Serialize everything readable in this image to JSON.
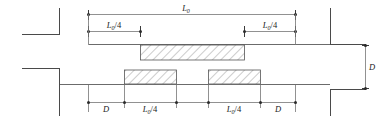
{
  "figure": {
    "type": "engineering-detail-drawing",
    "background_color": "#ffffff",
    "line_color": "#6b6b6b",
    "hatch_color": "#6d6d6d",
    "label_color": "#1a1a1a"
  },
  "labels": {
    "span_total": {
      "symbol": "L",
      "subscript": "0",
      "suffix": ""
    },
    "quarter_span": {
      "symbol": "L",
      "subscript": "0",
      "suffix": "/4"
    },
    "depth": {
      "symbol": "D",
      "subscript": "",
      "suffix": ""
    }
  },
  "label_text": {
    "L0": "L",
    "L0_sub": "0",
    "L0_quarter_suffix": "/4",
    "D": "D"
  },
  "dimension_chains": {
    "top": [
      {
        "id": "top-total",
        "label_key": "L0",
        "text": "L0",
        "x_start": 88,
        "x_end": 296,
        "y": 14
      },
      {
        "id": "top-left-quarter",
        "label_key": "L0/4",
        "text": "L0/4",
        "x_start": 88,
        "x_end": 140,
        "y": 31
      },
      {
        "id": "top-right-quarter",
        "label_key": "L0/4",
        "text": "L0/4",
        "x_start": 244,
        "x_end": 296,
        "y": 31
      }
    ],
    "bottom": [
      {
        "id": "bottom-left-D",
        "label_key": "D",
        "text": "D",
        "x_start": 88,
        "x_end": 124,
        "y": 102
      },
      {
        "id": "bottom-left-quarter",
        "label_key": "L0/4",
        "text": "L0/4",
        "x_start": 124,
        "x_end": 176,
        "y": 102
      },
      {
        "id": "bottom-right-quarter",
        "label_key": "L0/4",
        "text": "L0/4",
        "x_start": 208,
        "x_end": 260,
        "y": 102
      },
      {
        "id": "bottom-right-D",
        "label_key": "D",
        "text": "D",
        "x_start": 260,
        "x_end": 296,
        "y": 102
      }
    ],
    "right": [
      {
        "id": "right-vertical-D",
        "label_key": "D",
        "text": "D",
        "y_start": 45,
        "y_end": 90,
        "x": 366
      }
    ]
  },
  "hatched_regions": [
    {
      "id": "upper-beam-reinforcement",
      "x": 140,
      "y": 45,
      "width": 104,
      "height": 15
    },
    {
      "id": "lower-left-reinforcement",
      "x": 124,
      "y": 70,
      "width": 52,
      "height": 14
    },
    {
      "id": "lower-right-reinforcement",
      "x": 208,
      "y": 70,
      "width": 52,
      "height": 14
    }
  ],
  "structural_members": [
    {
      "id": "upper-left-column",
      "orientation": "corner"
    },
    {
      "id": "upper-right-column",
      "orientation": "corner"
    },
    {
      "id": "lower-left-column",
      "orientation": "corner"
    },
    {
      "id": "lower-right-column",
      "orientation": "corner"
    },
    {
      "id": "upper-beam-axis",
      "orientation": "horizontal"
    },
    {
      "id": "lower-beam-axis",
      "orientation": "horizontal"
    }
  ]
}
